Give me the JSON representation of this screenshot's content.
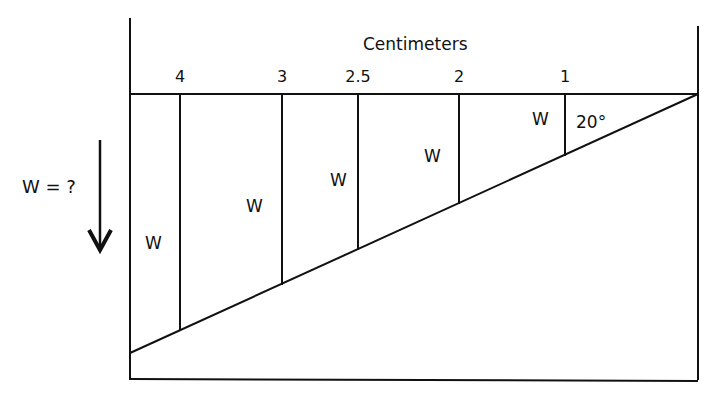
{
  "title": "Centimeters",
  "unknown_label": "W = ?",
  "angle_label": "20°",
  "ticks": [
    {
      "label": "4",
      "x": 180
    },
    {
      "label": "3",
      "x": 282
    },
    {
      "label": "2.5",
      "x": 358
    },
    {
      "label": "2",
      "x": 459
    },
    {
      "label": "1",
      "x": 565
    }
  ],
  "weight_labels": [
    "W",
    "W",
    "W",
    "W",
    "W"
  ],
  "colors": {
    "line": "#111111",
    "background": "#ffffff"
  }
}
